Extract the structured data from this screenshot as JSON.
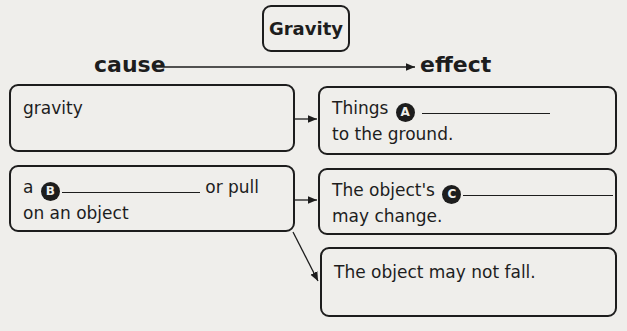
{
  "title": "Gravity",
  "header": {
    "cause_label": "cause",
    "effect_label": "effect"
  },
  "causes": [
    {
      "text": "gravity"
    },
    {
      "prefix": "a",
      "badge": "B",
      "suffix": "or pull",
      "line2": "on an object"
    }
  ],
  "effects": [
    {
      "prefix": "Things",
      "badge": "A",
      "line2": "to the ground."
    },
    {
      "prefix": "The object's",
      "badge": "C",
      "line2": "may change."
    },
    {
      "text": "The object may not fall."
    }
  ],
  "colors": {
    "ink": "#1d1d1d",
    "paper": "#efeeeb"
  }
}
